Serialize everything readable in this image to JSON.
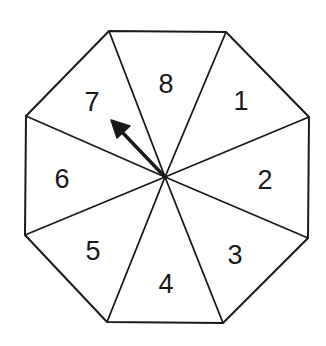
{
  "diagram": {
    "type": "spinner",
    "shape": "octagon",
    "sections": [
      {
        "label": "1",
        "x": 241,
        "y": 101
      },
      {
        "label": "2",
        "x": 265,
        "y": 180
      },
      {
        "label": "3",
        "x": 235,
        "y": 255
      },
      {
        "label": "4",
        "x": 166,
        "y": 284
      },
      {
        "label": "5",
        "x": 93,
        "y": 251
      },
      {
        "label": "6",
        "x": 62,
        "y": 179
      },
      {
        "label": "7",
        "x": 92,
        "y": 102
      },
      {
        "label": "8",
        "x": 166,
        "y": 84
      }
    ],
    "pointer": {
      "points_to": "7"
    },
    "colors": {
      "stroke": "#1a1a1a",
      "fill": "#ffffff"
    }
  }
}
